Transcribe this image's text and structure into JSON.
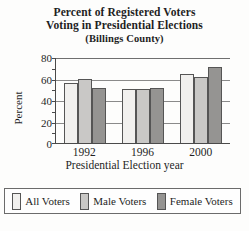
{
  "chart_data": {
    "type": "bar",
    "title": "Percent of Registered Voters Voting in Presidential Elections",
    "subtitle": "(Billings County)",
    "title_line1": "Percent of Registered Voters",
    "title_line2": "Voting in Presidential Elections",
    "xlabel": "Presidential Election year",
    "ylabel": "Percent",
    "categories": [
      "1992",
      "1996",
      "2000"
    ],
    "ylim": [
      0,
      80
    ],
    "yticks": [
      0,
      20,
      40,
      60,
      80
    ],
    "grid": true,
    "legend_position": "bottom",
    "series": [
      {
        "name": "All Voters",
        "color": "#f1f0ee",
        "values": [
          56,
          50,
          64
        ]
      },
      {
        "name": "Male Voters",
        "color": "#c9c8c6",
        "values": [
          60,
          50,
          61
        ]
      },
      {
        "name": "Female Voters",
        "color": "#959492",
        "values": [
          51,
          51,
          71
        ]
      }
    ]
  },
  "legend": {
    "items": [
      {
        "label": "All Voters"
      },
      {
        "label": "Male Voters"
      },
      {
        "label": "Female Voters"
      }
    ]
  },
  "axis": {
    "ytick_labels": [
      "80",
      "60",
      "40",
      "20",
      "0"
    ],
    "xtick_labels": [
      "1992",
      "1996",
      "2000"
    ]
  }
}
